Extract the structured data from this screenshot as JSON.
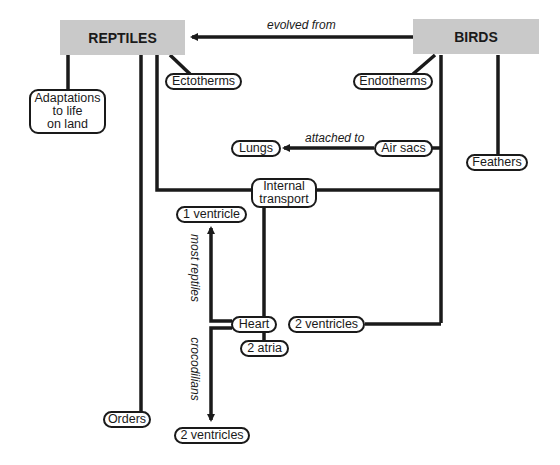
{
  "diagram": {
    "type": "concept-map",
    "main_concepts": {
      "reptiles": "REPTILES",
      "birds": "BIRDS"
    },
    "nodes": {
      "adaptations": "Adaptations\nto life\non land",
      "ectotherms": "Ectotherms",
      "endotherms": "Endotherms",
      "lungs": "Lungs",
      "air_sacs": "Air sacs",
      "feathers": "Feathers",
      "internal_transport": "Internal\ntransport",
      "one_ventricle": "1 ventricle",
      "heart": "Heart",
      "two_ventricles_right": "2 ventricles",
      "two_atria": "2 atria",
      "orders": "Orders",
      "two_ventricles_bottom": "2 ventricles"
    },
    "link_labels": {
      "evolved_from": "evolved from",
      "attached_to": "attached to",
      "most_reptiles": "most reptiles",
      "crocodilians": "crocodilians"
    },
    "colors": {
      "concept_fill": "#c9c9c9",
      "line": "#1a1a1a",
      "background": "#ffffff"
    }
  }
}
